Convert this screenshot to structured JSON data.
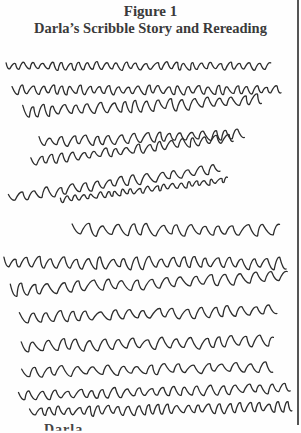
{
  "figure": {
    "number_label": "Figure 1",
    "title": "Darla’s Scribble Story and Rereading"
  },
  "footer": {
    "partial_text": "Darla"
  },
  "colors": {
    "ink": "#2d2d2d",
    "caption": "#3a3a3a",
    "paper": "#fefefe",
    "border": "#555555"
  },
  "scribble_lines": [
    {
      "x0": 6,
      "x1": 275,
      "y": 66,
      "amp": 7,
      "period": 9.5,
      "tilt": 0
    },
    {
      "x0": 12,
      "x1": 282,
      "y": 90,
      "amp": 8,
      "period": 10,
      "tilt": 0
    },
    {
      "x0": 22,
      "x1": 265,
      "y": 112,
      "amp": 11,
      "period": 12,
      "tilt": -0.05
    },
    {
      "x0": 40,
      "x1": 250,
      "y": 142,
      "amp": 9,
      "period": 12,
      "tilt": -0.04
    },
    {
      "x0": 30,
      "x1": 240,
      "y": 162,
      "amp": 8,
      "period": 11,
      "tilt": -0.12
    },
    {
      "x0": 8,
      "x1": 225,
      "y": 198,
      "amp": 9,
      "period": 13,
      "tilt": -0.14
    },
    {
      "x0": 60,
      "x1": 228,
      "y": 200,
      "amp": 5,
      "period": 8,
      "tilt": -0.12
    },
    {
      "x0": 72,
      "x1": 286,
      "y": 230,
      "amp": 11,
      "period": 15,
      "tilt": 0
    },
    {
      "x0": 4,
      "x1": 290,
      "y": 263,
      "amp": 11,
      "period": 12,
      "tilt": 0
    },
    {
      "x0": 10,
      "x1": 288,
      "y": 290,
      "amp": 11,
      "period": 15,
      "tilt": -0.05
    },
    {
      "x0": 20,
      "x1": 285,
      "y": 318,
      "amp": 10,
      "period": 14,
      "tilt": -0.03
    },
    {
      "x0": 22,
      "x1": 282,
      "y": 346,
      "amp": 11,
      "period": 14,
      "tilt": -0.02
    },
    {
      "x0": 22,
      "x1": 275,
      "y": 372,
      "amp": 9,
      "period": 14,
      "tilt": -0.02
    },
    {
      "x0": 18,
      "x1": 292,
      "y": 396,
      "amp": 9,
      "period": 12,
      "tilt": -0.03
    },
    {
      "x0": 30,
      "x1": 294,
      "y": 412,
      "amp": 9,
      "period": 10,
      "tilt": -0.02
    }
  ]
}
